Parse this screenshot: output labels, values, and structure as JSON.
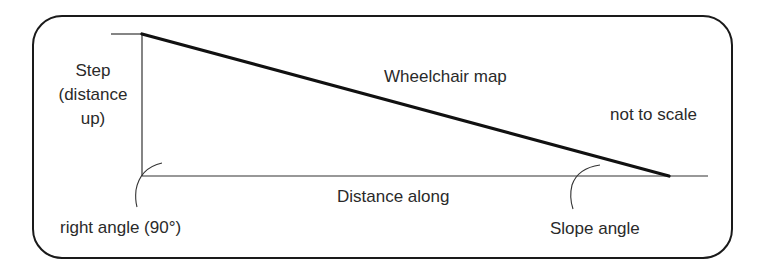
{
  "diagram": {
    "title": "Wheelchair map",
    "note": "not to scale",
    "labels": {
      "step_line1": "Step",
      "step_line2": "(distance",
      "step_line3": "up)",
      "distance_along": "Distance along",
      "right_angle": "right angle (90°)",
      "slope_angle": "Slope angle"
    },
    "geometry": {
      "vertical_leg": {
        "x": 142,
        "y_top": 34,
        "y_bottom": 176
      },
      "horizontal_leg": {
        "y": 176,
        "x_start": 142,
        "x_end": 708
      },
      "hypotenuse": {
        "from": [
          142,
          34
        ],
        "to": [
          669,
          176
        ]
      }
    },
    "colors": {
      "line": "#1a1a1a",
      "text": "#2a2a2a",
      "background": "#ffffff"
    }
  }
}
